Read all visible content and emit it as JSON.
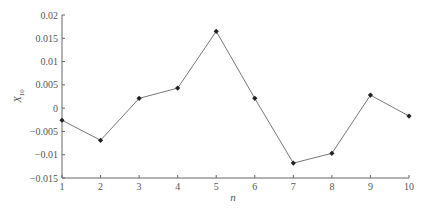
{
  "chart_data": {
    "type": "line",
    "title": "",
    "xlabel": "n",
    "ylabel": "X",
    "ylabel_sub": "10",
    "x": [
      1,
      2,
      3,
      4,
      5,
      6,
      7,
      8,
      9,
      10
    ],
    "series": [
      {
        "name": "X10",
        "values": [
          -0.0026,
          -0.0069,
          0.0021,
          0.0043,
          0.0165,
          0.0021,
          -0.0118,
          -0.0097,
          0.0028,
          -0.0017
        ],
        "marker": "diamond",
        "color": "#555555",
        "marker_color": "#222222"
      }
    ],
    "xlim": [
      1,
      10
    ],
    "ylim": [
      -0.015,
      0.02
    ],
    "xticks": [
      1,
      2,
      3,
      4,
      5,
      6,
      7,
      8,
      9,
      10
    ],
    "yticks": [
      -0.015,
      -0.01,
      -0.005,
      0,
      0.005,
      0.01,
      0.015,
      0.02
    ],
    "ytick_labels": [
      "−0.015",
      "−0.01",
      "−0.005",
      "0",
      "0.005",
      "0.01",
      "0.015",
      "0.02"
    ],
    "grid": false,
    "legend": null
  },
  "colors": {
    "axis": "#666666",
    "line": "#777777",
    "marker": "#222222",
    "text": "#555555"
  }
}
